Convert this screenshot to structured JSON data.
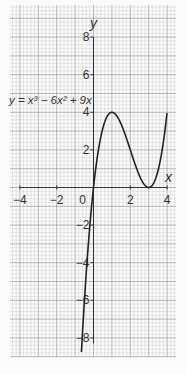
{
  "chart_data": {
    "type": "line",
    "title": "",
    "equation_label": "y = x³ − 6x² + 9x",
    "xlabel": "x",
    "ylabel": "y",
    "xlim": [
      -4,
      4
    ],
    "ylim": [
      -9,
      9
    ],
    "x_ticks": [
      -4,
      -2,
      0,
      2,
      4
    ],
    "x_tick_labels": [
      "−4",
      "−2",
      "0",
      "2",
      "4"
    ],
    "y_ticks": [
      8,
      6,
      4,
      2,
      -2,
      -4,
      -6,
      -8
    ],
    "y_tick_labels": [
      "8",
      "6",
      "4",
      "2",
      "−2",
      "−4",
      "−6",
      "−8"
    ],
    "grid": true,
    "grid_minor_per_unit": 5,
    "series": [
      {
        "name": "y = x^3 - 6x^2 + 9x",
        "function": "x^3 - 6x^2 + 9x",
        "x": [
          -0.65,
          -0.5,
          -0.25,
          0,
          0.25,
          0.5,
          0.75,
          1,
          1.25,
          1.5,
          1.75,
          2,
          2.25,
          2.5,
          2.75,
          3,
          3.25,
          3.5,
          3.75,
          4
        ],
        "y": [
          -8.63,
          -6.13,
          -2.64,
          0,
          1.89,
          3.13,
          3.8,
          4,
          3.83,
          3.38,
          2.73,
          2,
          1.27,
          0.63,
          0.17,
          0,
          0.2,
          0.88,
          2.11,
          4
        ],
        "color": "#222222"
      }
    ],
    "key_points": {
      "local_max": [
        1,
        4
      ],
      "local_min": [
        3,
        0
      ],
      "roots": [
        0,
        3
      ]
    }
  },
  "colors": {
    "grid_minor": "#c9c9c9",
    "grid_major": "#9a9a9a",
    "axis": "#333333",
    "curve": "#222222",
    "paper": "#fbfbfb"
  }
}
